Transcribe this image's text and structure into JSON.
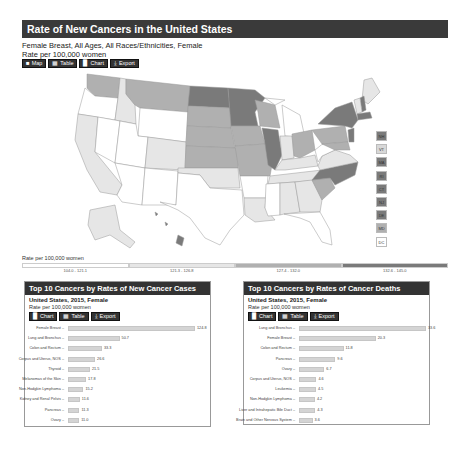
{
  "header": {
    "title": "Rate of New Cancers in the United States",
    "subtitle_line1": "Female Breast, All Ages, All Races/Ethnicities, Female",
    "subtitle_line2": "Rate per 100,000 women"
  },
  "toolbar": {
    "buttons": [
      {
        "label": "Map",
        "icon": "us-map-icon"
      },
      {
        "label": "Table",
        "icon": "table-grid-icon"
      },
      {
        "label": "Chart",
        "icon": "bar-chart-icon"
      },
      {
        "label": "Export",
        "icon": "download-icon"
      }
    ]
  },
  "map": {
    "small_states": [
      "NH",
      "VT",
      "MA",
      "RI",
      "CT",
      "NJ",
      "DE",
      "MD",
      "DC"
    ],
    "small_state_colors": [
      "#7a7a7a",
      "#d8d8d8",
      "#7a7a7a",
      "#7a7a7a",
      "#7a7a7a",
      "#7a7a7a",
      "#7a7a7a",
      "#b0b0b0",
      "#ffffff"
    ],
    "colors": {
      "q1": "#ffffff",
      "q2": "#e6e6e6",
      "q3": "#b0b0b0",
      "q4": "#7a7a7a",
      "border": "#999999"
    }
  },
  "legend": {
    "title": "Rate per 100,000 women",
    "bins": [
      {
        "label": "104.0 - 121.1",
        "color": "#ffffff"
      },
      {
        "label": "121.3 - 126.8",
        "color": "#e6e6e6"
      },
      {
        "label": "127.4 - 132.0",
        "color": "#b0b0b0"
      },
      {
        "label": "132.6 - 145.0",
        "color": "#7a7a7a"
      }
    ]
  },
  "panels": [
    {
      "title": "Top 10 Cancers by Rates of New Cancer Cases",
      "sub1": "United States, 2015, Female",
      "sub2": "Rate per 100,000 women",
      "buttons": [
        {
          "label": "Chart",
          "icon": "bar-chart-icon"
        },
        {
          "label": "Table",
          "icon": "table-grid-icon"
        },
        {
          "label": "Export",
          "icon": "download-icon"
        }
      ]
    },
    {
      "title": "Top 10 Cancers by Rates of Cancer Deaths",
      "sub1": "United States, 2015, Female",
      "sub2": "Rate per 100,000 women",
      "buttons": [
        {
          "label": "Chart",
          "icon": "bar-chart-icon"
        },
        {
          "label": "Table",
          "icon": "table-grid-icon"
        },
        {
          "label": "Export",
          "icon": "download-icon"
        }
      ]
    }
  ],
  "chart_data": [
    {
      "type": "bar",
      "orientation": "horizontal",
      "title": "Top 10 Cancers by Rates of New Cancer Cases",
      "subtitle": "United States, 2015, Female",
      "ylabel": "Rate per 100,000 women",
      "categories": [
        "Female Breast",
        "Lung and Bronchus",
        "Colon and Rectum",
        "Corpus and Uterus, NOS",
        "Thyroid",
        "Melanomas of the Skin",
        "Non-Hodgkin Lymphoma",
        "Kidney and Renal Pelvis",
        "Pancreas",
        "Ovary"
      ],
      "values": [
        124.8,
        50.7,
        33.3,
        26.6,
        21.5,
        17.8,
        15.2,
        11.6,
        11.3,
        11.0
      ],
      "value_labels": [
        "124.8",
        "50.7",
        "33.3",
        "26.6",
        "21.5",
        "17.8",
        "15.2",
        "11.6",
        "11.3",
        "11.0"
      ]
    },
    {
      "type": "bar",
      "orientation": "horizontal",
      "title": "Top 10 Cancers by Rates of Cancer Deaths",
      "subtitle": "United States, 2015, Female",
      "ylabel": "Rate per 100,000 women",
      "categories": [
        "Lung and Bronchus",
        "Female Breast",
        "Colon and Rectum",
        "Pancreas",
        "Ovary",
        "Corpus and Uterus, NOS",
        "Leukemia",
        "Non-Hodgkin Lymphoma",
        "Liver and Intrahepatic Bile Duct",
        "Brain and Other Nervous System"
      ],
      "values": [
        33.6,
        20.3,
        11.8,
        9.6,
        6.7,
        4.6,
        4.5,
        4.2,
        4.3,
        3.6
      ],
      "value_labels": [
        "33.6",
        "20.3",
        "11.8",
        "9.6",
        "6.7",
        "4.6",
        "4.5",
        "4.2",
        "4.3",
        "3.6"
      ]
    }
  ]
}
